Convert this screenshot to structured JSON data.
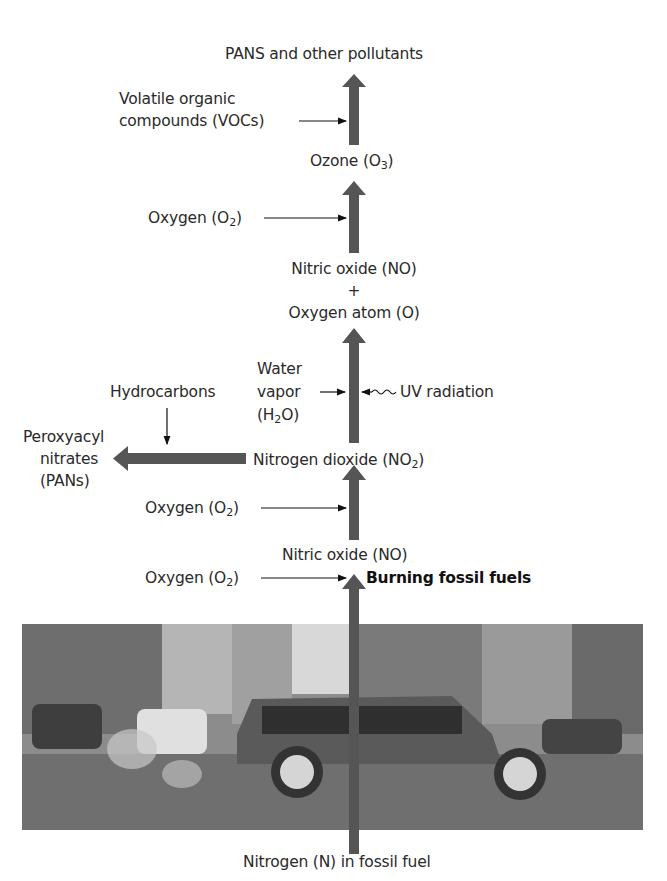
{
  "diagram": {
    "colors": {
      "main_arrow": "#555555",
      "thin_arrow": "#111111",
      "text": "#2a2a2a"
    },
    "nodes": {
      "top_product": "PANS and other pollutants",
      "ozone": {
        "text": "Ozone (O",
        "sub": "3",
        "close": ")"
      },
      "nitric_oxide_plus": {
        "line1": "Nitric oxide (NO)",
        "plus": "+",
        "line2": "Oxygen atom (O)"
      },
      "nitrogen_dioxide": {
        "text": "Nitrogen dioxide (NO",
        "sub": "2",
        "close": ")"
      },
      "pans": {
        "line1": "Peroxyacyl",
        "line2": "nitrates",
        "line3": "(PANs)"
      },
      "nitric_oxide": "Nitric oxide (NO)",
      "burning": "Burning fossil fuels",
      "source": "Nitrogen (N) in fossil fuel"
    },
    "inputs": {
      "vocs": {
        "line1": "Volatile organic",
        "line2": "compounds (VOCs)"
      },
      "oxygen_upper": {
        "text": "Oxygen (O",
        "sub": "2",
        "close": ")"
      },
      "water": {
        "line1": "Water",
        "line2": "vapor",
        "line3_pre": "(H",
        "line3_sub": "2",
        "line3_post": "O)"
      },
      "uv": "UV radiation",
      "hydrocarbons": "Hydrocarbons",
      "oxygen_middle": {
        "text": "Oxygen (O",
        "sub": "2",
        "close": ")"
      },
      "oxygen_lower": {
        "text": "Oxygen (O",
        "sub": "2",
        "close": ")"
      }
    },
    "photo": {
      "description": "City street scene with SUV emitting exhaust"
    }
  }
}
